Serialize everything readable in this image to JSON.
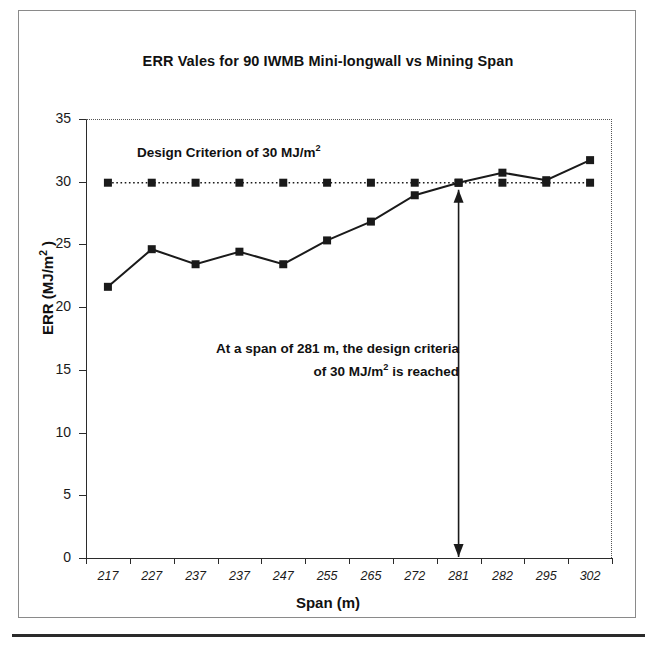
{
  "figure": {
    "title": "ERR Vales for 90 IWMB Mini-longwall vs Mining Span",
    "x_axis_title": "Span (m)",
    "y_axis_title_main": "ERR (MJ/m",
    "y_axis_title_sup": "2",
    "y_axis_title_close": " )",
    "annotations": {
      "criterion_main": "Design Criterion of 30 MJ/m",
      "criterion_sup": "2",
      "reached_line1": "At a span of 281 m, the design criteria",
      "reached_line2_a": "of 30 MJ/m",
      "reached_line2_sup": "2",
      "reached_line2_b": " is reached"
    }
  },
  "chart_data": {
    "type": "line",
    "title": "ERR Vales for 90 IWMB Mini-longwall vs Mining Span",
    "xlabel": "Span (m)",
    "ylabel": "ERR (MJ/m2)",
    "categories": [
      "217",
      "227",
      "237",
      "237",
      "247",
      "255",
      "265",
      "272",
      "281",
      "282",
      "295",
      "302"
    ],
    "ylim": [
      0,
      35
    ],
    "yticks": [
      0,
      5,
      10,
      15,
      20,
      25,
      30,
      35
    ],
    "grid": false,
    "legend": "none",
    "series": [
      {
        "name": "ERR",
        "style": "solid-line-square-markers",
        "color": "#1a1a1a",
        "values": [
          21.7,
          24.7,
          23.5,
          24.5,
          23.5,
          25.4,
          26.9,
          29.0,
          30.0,
          30.8,
          30.2,
          31.8
        ]
      },
      {
        "name": "Design Criterion",
        "style": "dotted-line-square-markers",
        "color": "#1a1a1a",
        "values": [
          30,
          30,
          30,
          30,
          30,
          30,
          30,
          30,
          30,
          30,
          30,
          30
        ]
      }
    ],
    "annotations": [
      {
        "name": "design-criterion-label",
        "text": "Design Criterion of 30 MJ/m2"
      },
      {
        "name": "span-reached-label",
        "text": "At a span of 281 m, the design criteria of 30 MJ/m2 is reached"
      },
      {
        "name": "span-281-arrow",
        "text": "double-headed vertical arrow at span 281 from 0 to 30"
      }
    ]
  },
  "axes": {
    "y_ticks": [
      "35",
      "30",
      "25",
      "20",
      "15",
      "10",
      "5",
      "0"
    ]
  },
  "colors": {
    "ink": "#1a1a1a",
    "frame": "#8a8a8a",
    "rule": "#2a2a2a"
  }
}
